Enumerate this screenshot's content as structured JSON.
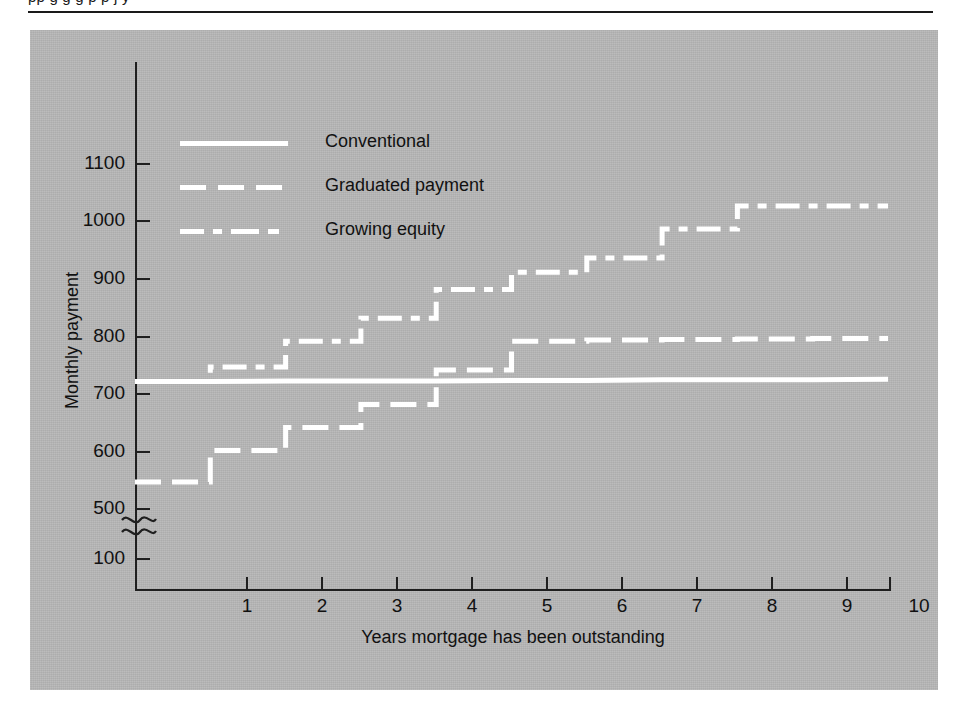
{
  "page": {
    "cutoff_text_above_rule": "pp g g g p p j y",
    "rule_color": "#1a1a1a",
    "panel_color": "#b8b8b8",
    "series_color": "#ffffff",
    "axis_color": "#1f1f1f"
  },
  "legend": {
    "position": "inside-top-left",
    "entries": [
      {
        "label": "Conventional",
        "style": "solid",
        "swatch": "legend-swatch-solid"
      },
      {
        "label": "Graduated payment",
        "style": "dashed",
        "swatch": "legend-swatch-dashed"
      },
      {
        "label": "Growing equity",
        "style": "dash-dot",
        "swatch": "legend-swatch-dashdot"
      }
    ]
  },
  "axes": {
    "y": {
      "title": "Monthly payment",
      "ticks": [
        "1100",
        "1000",
        "900",
        "800",
        "700",
        "600",
        "500",
        "100"
      ],
      "has_break": true,
      "break_between": [
        "500",
        "100"
      ]
    },
    "x": {
      "title": "Years mortgage has been outstanding",
      "ticks": [
        "1",
        "2",
        "3",
        "4",
        "5",
        "6",
        "7",
        "8",
        "9",
        "10"
      ]
    }
  },
  "chart_data": {
    "type": "line",
    "subtype": "step",
    "title": "",
    "subtitle": "",
    "xlabel": "Years mortgage has been outstanding",
    "ylabel": "Monthly payment",
    "xlim": [
      0,
      10
    ],
    "ylim": [
      100,
      1150
    ],
    "y_axis_break": {
      "from": 100,
      "to": 500
    },
    "grid": false,
    "legend_position": "upper left (inside plot)",
    "x": [
      0,
      1,
      2,
      3,
      4,
      5,
      6,
      7,
      8,
      9,
      10
    ],
    "series": [
      {
        "name": "Conventional",
        "style": "solid",
        "step": false,
        "values": [
          720,
          720,
          721,
          721,
          721,
          722,
          722,
          723,
          723,
          723,
          724
        ]
      },
      {
        "name": "Graduated payment",
        "style": "dashed",
        "step": true,
        "note": "constant within each year, steps up at each year boundary",
        "step_values": [
          545,
          600,
          640,
          680,
          740,
          790,
          792,
          793,
          794,
          795
        ]
      },
      {
        "name": "Growing equity",
        "style": "dash-dot",
        "step": true,
        "note": "constant within each year, steps up at each year boundary",
        "step_values": [
          720,
          745,
          790,
          830,
          880,
          910,
          935,
          1025,
          1025,
          1025
        ]
      }
    ],
    "series_detail_growing_equity": {
      "years": [
        1,
        2,
        3,
        4,
        5,
        6,
        7,
        8,
        9,
        10
      ],
      "values": [
        720,
        745,
        790,
        830,
        880,
        910,
        935,
        985,
        1025,
        1025
      ]
    }
  }
}
